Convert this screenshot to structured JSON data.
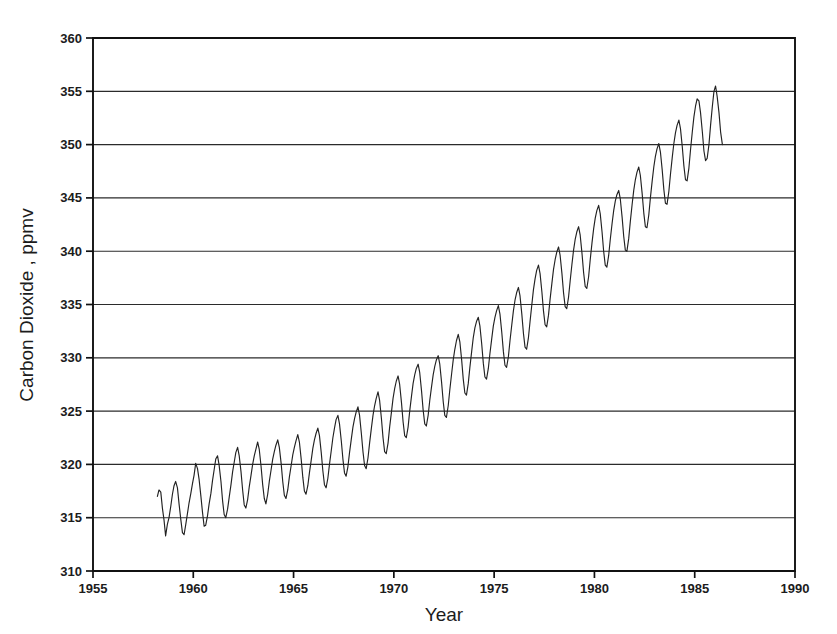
{
  "chart_data": {
    "type": "line",
    "title": "",
    "xlabel": "Year",
    "ylabel": "Carbon Dioxide , ppmv",
    "xlim": [
      1955,
      1990
    ],
    "ylim": [
      310,
      360
    ],
    "grid": "horizontal",
    "legend": "none",
    "series_name": "Atmospheric CO2 concentration",
    "xticks": [
      1955,
      1960,
      1965,
      1970,
      1975,
      1980,
      1985,
      1990
    ],
    "xtick_labels": [
      "1955",
      "1960",
      "1965",
      "1970",
      "1975",
      "1980",
      "1985",
      "1990"
    ],
    "yticks": [
      310,
      315,
      320,
      325,
      330,
      335,
      340,
      345,
      350,
      355,
      360
    ],
    "ytick_labels": [
      "310",
      "315",
      "320",
      "325",
      "330",
      "335",
      "340",
      "345",
      "350",
      "355",
      "360"
    ],
    "line_color": "#222222",
    "data_start_x": 1958.21,
    "data_end_x": 1989.79,
    "x": [
      1958.21,
      1958.29,
      1958.38,
      1958.46,
      1958.54,
      1958.62,
      1958.71,
      1958.79,
      1958.88,
      1958.96,
      1959.04,
      1959.12,
      1959.21,
      1959.29,
      1959.38,
      1959.46,
      1959.54,
      1959.62,
      1959.71,
      1959.79,
      1959.88,
      1959.96,
      1960.04,
      1960.12,
      1960.21,
      1960.29,
      1960.38,
      1960.46,
      1960.54,
      1960.62,
      1960.71,
      1960.79,
      1960.88,
      1960.96,
      1961.04,
      1961.12,
      1961.21,
      1961.29,
      1961.38,
      1961.46,
      1961.54,
      1961.62,
      1961.71,
      1961.79,
      1961.88,
      1961.96,
      1962.04,
      1962.12,
      1962.21,
      1962.29,
      1962.38,
      1962.46,
      1962.54,
      1962.62,
      1962.71,
      1962.79,
      1962.88,
      1962.96,
      1963.04,
      1963.12,
      1963.21,
      1963.29,
      1963.38,
      1963.46,
      1963.54,
      1963.62,
      1963.71,
      1963.79,
      1963.88,
      1963.96,
      1964.04,
      1964.12,
      1964.21,
      1964.29,
      1964.38,
      1964.46,
      1964.54,
      1964.62,
      1964.71,
      1964.79,
      1964.88,
      1964.96,
      1965.04,
      1965.12,
      1965.21,
      1965.29,
      1965.38,
      1965.46,
      1965.54,
      1965.62,
      1965.71,
      1965.79,
      1965.88,
      1965.96,
      1966.04,
      1966.12,
      1966.21,
      1966.29,
      1966.38,
      1966.46,
      1966.54,
      1966.62,
      1966.71,
      1966.79,
      1966.88,
      1966.96,
      1967.04,
      1967.12,
      1967.21,
      1967.29,
      1967.38,
      1967.46,
      1967.54,
      1967.62,
      1967.71,
      1967.79,
      1967.88,
      1967.96,
      1968.04,
      1968.12,
      1968.21,
      1968.29,
      1968.38,
      1968.46,
      1968.54,
      1968.62,
      1968.71,
      1968.79,
      1968.88,
      1968.96,
      1969.04,
      1969.12,
      1969.21,
      1969.29,
      1969.38,
      1969.46,
      1969.54,
      1969.62,
      1969.71,
      1969.79,
      1969.88,
      1969.96,
      1970.04,
      1970.12,
      1970.21,
      1970.29,
      1970.38,
      1970.46,
      1970.54,
      1970.62,
      1970.71,
      1970.79,
      1970.88,
      1970.96,
      1971.04,
      1971.12,
      1971.21,
      1971.29,
      1971.38,
      1971.46,
      1971.54,
      1971.62,
      1971.71,
      1971.79,
      1971.88,
      1971.96,
      1972.04,
      1972.12,
      1972.21,
      1972.29,
      1972.38,
      1972.46,
      1972.54,
      1972.62,
      1972.71,
      1972.79,
      1972.88,
      1972.96,
      1973.04,
      1973.12,
      1973.21,
      1973.29,
      1973.38,
      1973.46,
      1973.54,
      1973.62,
      1973.71,
      1973.79,
      1973.88,
      1973.96,
      1974.04,
      1974.12,
      1974.21,
      1974.29,
      1974.38,
      1974.46,
      1974.54,
      1974.62,
      1974.71,
      1974.79,
      1974.88,
      1974.96,
      1975.04,
      1975.12,
      1975.21,
      1975.29,
      1975.38,
      1975.46,
      1975.54,
      1975.62,
      1975.71,
      1975.79,
      1975.88,
      1975.96,
      1976.04,
      1976.12,
      1976.21,
      1976.29,
      1976.38,
      1976.46,
      1976.54,
      1976.62,
      1976.71,
      1976.79,
      1976.88,
      1976.96,
      1977.04,
      1977.12,
      1977.21,
      1977.29,
      1977.38,
      1977.46,
      1977.54,
      1977.62,
      1977.71,
      1977.79,
      1977.88,
      1977.96,
      1978.04,
      1978.12,
      1978.21,
      1978.29,
      1978.38,
      1978.46,
      1978.54,
      1978.62,
      1978.71,
      1978.79,
      1978.88,
      1978.96,
      1979.04,
      1979.12,
      1979.21,
      1979.29,
      1979.38,
      1979.46,
      1979.54,
      1979.62,
      1979.71,
      1979.79,
      1979.88,
      1979.96,
      1980.04,
      1980.12,
      1980.21,
      1980.29,
      1980.38,
      1980.46,
      1980.54,
      1980.62,
      1980.71,
      1980.79,
      1980.88,
      1980.96,
      1981.04,
      1981.12,
      1981.21,
      1981.29,
      1981.38,
      1981.46,
      1981.54,
      1981.62,
      1981.71,
      1981.79,
      1981.88,
      1981.96,
      1982.04,
      1982.12,
      1982.21,
      1982.29,
      1982.38,
      1982.46,
      1982.54,
      1982.62,
      1982.71,
      1982.79,
      1982.88,
      1982.96,
      1983.04,
      1983.12,
      1983.21,
      1983.29,
      1983.38,
      1983.46,
      1983.54,
      1983.62,
      1983.71,
      1983.79,
      1983.88,
      1983.96,
      1984.04,
      1984.12,
      1984.21,
      1984.29,
      1984.38,
      1984.46,
      1984.54,
      1984.62,
      1984.71,
      1984.79,
      1984.88,
      1984.96,
      1985.04,
      1985.12,
      1985.21,
      1985.29,
      1985.38,
      1985.46,
      1985.54,
      1985.62,
      1985.71,
      1985.79,
      1985.88,
      1985.96,
      1986.04,
      1986.12,
      1986.21,
      1986.29,
      1986.38,
      1986.46,
      1986.54,
      1986.62,
      1986.71,
      1986.79,
      1986.88,
      1986.96,
      1987.04,
      1987.12,
      1987.21,
      1987.29,
      1987.38,
      1987.46,
      1987.54,
      1987.62,
      1987.71,
      1987.79,
      1987.88,
      1987.96,
      1988.04,
      1988.12,
      1988.21,
      1988.29,
      1988.38,
      1988.46,
      1988.54,
      1988.62,
      1988.71,
      1988.79,
      1988.88,
      1988.96,
      1989.04,
      1989.12,
      1989.21,
      1989.29,
      1989.38,
      1989.46,
      1989.54,
      1989.62,
      1989.71,
      1989.79
    ],
    "y": [
      317.0,
      317.6,
      317.4,
      315.9,
      314.8,
      313.3,
      314.4,
      315.0,
      316.1,
      317.2,
      318.0,
      318.4,
      317.8,
      316.3,
      314.8,
      313.6,
      313.4,
      314.3,
      315.4,
      316.4,
      317.3,
      318.2,
      319.0,
      320.1,
      319.6,
      318.6,
      317.0,
      315.5,
      314.2,
      314.3,
      315.2,
      316.3,
      317.3,
      318.5,
      319.5,
      320.5,
      320.8,
      319.9,
      318.4,
      316.6,
      315.3,
      315.0,
      315.8,
      316.9,
      318.1,
      319.3,
      320.2,
      321.1,
      321.6,
      320.8,
      319.3,
      317.6,
      316.2,
      315.9,
      316.7,
      317.9,
      319.0,
      320.0,
      320.8,
      321.4,
      322.1,
      321.4,
      319.8,
      318.1,
      316.8,
      316.3,
      317.2,
      318.4,
      319.5,
      320.5,
      321.2,
      321.8,
      322.3,
      321.6,
      320.1,
      318.4,
      317.1,
      316.8,
      317.6,
      318.8,
      319.9,
      320.9,
      321.6,
      322.2,
      322.8,
      322.1,
      320.5,
      318.8,
      317.5,
      317.2,
      318.0,
      319.2,
      320.4,
      321.5,
      322.3,
      322.9,
      323.4,
      322.7,
      321.1,
      319.4,
      318.1,
      317.8,
      318.7,
      320.0,
      321.3,
      322.5,
      323.4,
      324.2,
      324.6,
      323.8,
      322.2,
      320.5,
      319.2,
      318.9,
      319.8,
      321.1,
      322.4,
      323.5,
      324.3,
      324.9,
      325.4,
      324.6,
      322.9,
      321.2,
      319.9,
      319.6,
      320.6,
      322.0,
      323.4,
      324.6,
      325.5,
      326.2,
      326.8,
      326.0,
      324.3,
      322.5,
      321.2,
      321.0,
      322.0,
      323.5,
      324.9,
      326.2,
      327.1,
      327.8,
      328.3,
      327.5,
      325.8,
      324.0,
      322.7,
      322.5,
      323.5,
      325.0,
      326.4,
      327.6,
      328.4,
      329.0,
      329.4,
      328.6,
      326.9,
      325.1,
      323.8,
      323.6,
      324.6,
      326.0,
      327.3,
      328.4,
      329.2,
      329.8,
      330.2,
      329.4,
      327.7,
      325.9,
      324.6,
      324.4,
      325.5,
      327.0,
      328.5,
      329.8,
      330.8,
      331.6,
      332.2,
      331.5,
      329.8,
      328.0,
      326.7,
      326.5,
      327.6,
      329.1,
      330.6,
      331.9,
      332.8,
      333.4,
      333.8,
      333.0,
      331.3,
      329.5,
      328.2,
      328.0,
      329.0,
      330.4,
      331.8,
      333.0,
      333.8,
      334.4,
      334.9,
      334.1,
      332.4,
      330.6,
      329.3,
      329.1,
      330.1,
      331.6,
      333.1,
      334.4,
      335.4,
      336.1,
      336.6,
      335.8,
      334.1,
      332.3,
      331.0,
      330.8,
      331.9,
      333.4,
      335.0,
      336.4,
      337.4,
      338.2,
      338.7,
      337.9,
      336.2,
      334.4,
      333.1,
      332.9,
      334.0,
      335.5,
      337.0,
      338.3,
      339.2,
      339.9,
      340.4,
      339.6,
      337.9,
      336.1,
      334.8,
      334.6,
      335.7,
      337.2,
      338.8,
      340.1,
      341.1,
      341.8,
      342.3,
      341.5,
      339.8,
      338.0,
      336.7,
      336.5,
      337.6,
      339.2,
      340.8,
      342.1,
      343.1,
      343.8,
      344.3,
      343.5,
      341.8,
      340.0,
      338.7,
      338.5,
      339.6,
      341.1,
      342.6,
      343.8,
      344.7,
      345.3,
      345.7,
      344.9,
      343.2,
      341.4,
      340.1,
      340.0,
      341.2,
      342.8,
      344.4,
      345.7,
      346.7,
      347.4,
      347.9,
      347.1,
      345.4,
      343.6,
      342.3,
      342.2,
      343.4,
      345.0,
      346.6,
      347.9,
      348.9,
      349.6,
      350.1,
      349.3,
      347.6,
      345.8,
      344.5,
      344.4,
      345.6,
      347.2,
      348.8,
      350.1,
      351.1,
      351.8,
      352.3,
      351.5,
      349.8,
      348.0,
      346.7,
      346.6,
      347.8,
      349.5,
      351.2,
      352.6,
      353.6,
      354.3,
      354.1,
      353.0,
      351.2,
      349.4,
      348.5,
      348.7,
      350.0,
      351.8,
      353.6,
      355.0,
      355.5,
      354.5,
      353.0,
      351.2,
      350.0
    ]
  },
  "figure": {
    "background_color": "#ffffff",
    "axis_color": "#111111",
    "grid_color": "#2b2b2b"
  }
}
